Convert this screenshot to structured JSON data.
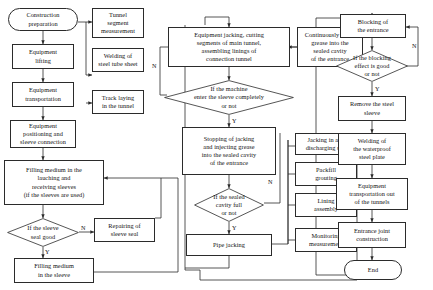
{
  "diagram": {
    "type": "flowchart",
    "colors": {
      "stroke": "#2b2b2b",
      "text": "#111111",
      "background": "#ffffff"
    }
  },
  "nodes": {
    "construction_preparation": "Construction\npreparation",
    "tunnel_segment_measurement": "Tunnel\nsegment\nmeasurement",
    "equipment_lifting": "Equipment\nlifting",
    "welding_steel_tube_sheet": "Welding of\nsteel tube sheet",
    "equipment_transportation": "Equipment\ntransportation",
    "track_laying_tunnel": "Track laying\nin the tunnel",
    "equipment_positioning": "Equipment\npositioning and\nsleeve connection",
    "filling_medium_launching": "Filling medium in the\nlauching and\nreceiving sleeves\n(if the sleeves are used)",
    "if_sleeve_seal_good": "If the sleeve\nseal good",
    "repairing_sleeve_seal": "Repairing of\nsleeve seal",
    "filling_medium_sleeve": "Filling medium\nin the sleeve",
    "equipment_jacking_cutting": "Equipment jacking, cutting\nsegments of main tunnel,\nassembling linings of\nconnection tunnel",
    "if_machine_enter_sleeve": "If the machine\nenter the sleeve completely\nor not",
    "stopping_of_jacking": "Stopping of jacking\nand injecting grease\ninto the sealed cavity\nof the entrance",
    "if_sealed_cavity_full": "If the sealed\ncavity full\nor not",
    "pipe_jacking": "Pipe jacking",
    "continuously_inject_grease": "Continuously inject\ngrease into the\nsealed cavity\nof the entrance",
    "jacking_discharging_soil": "Jacking in and\ndischarging soil",
    "packfill_grouting": "Packfill\ngrouting",
    "lining_assembly": "Lining\nassembly",
    "monitoring_measurement": "Monitoring\nmeasurement",
    "blocking_of_entrance": "Blocking of\nthe entrance",
    "if_blocking_effect_good": "If the blocking\neffect is good\nor not",
    "remove_steel_sleeve": "Remove the steel\nsleeve",
    "welding_waterproof_plate": "Welding of\nthe waterproof\nsteel plate",
    "equipment_transport_out": "Equipment\ntransportation out\nof the tunnels",
    "entrance_joint_construction": "Entrance joint\nconstruction",
    "end": "End"
  },
  "edge_labels": {
    "sleeve_seal_no": "N",
    "sleeve_seal_yes": "Y",
    "machine_enter_no": "N",
    "machine_enter_yes": "Y",
    "sealed_cavity_no": "N",
    "sealed_cavity_yes": "Y",
    "blocking_no": "N",
    "blocking_yes": "Y"
  }
}
